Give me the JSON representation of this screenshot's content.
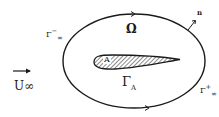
{
  "diagram": {
    "type": "flow-domain-schematic",
    "labels": {
      "domain": "Ω",
      "airfoil_area": "A",
      "airfoil_boundary": "Γ",
      "airfoil_boundary_sub": "A",
      "outer_boundary_inflow": "Γ",
      "outer_boundary_inflow_sup": "−",
      "outer_boundary_inflow_sub": "∞",
      "outer_boundary_outflow": "Γ",
      "outer_boundary_outflow_sup": "+",
      "outer_boundary_outflow_sub": "∞",
      "normal_vector": "n",
      "freestream": "U",
      "freestream_sub": "∞"
    },
    "colors": {
      "stroke": "#1a1a1a",
      "background": "#ffffff"
    }
  }
}
